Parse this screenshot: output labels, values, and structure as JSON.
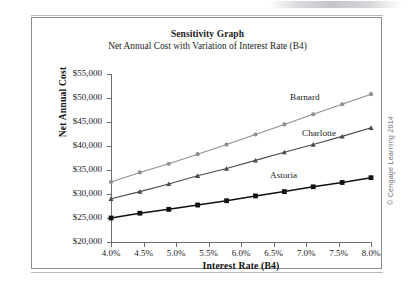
{
  "figure": {
    "credit": "© Cengage Learning 2014"
  },
  "chart_data": {
    "type": "line",
    "title": "Sensitivity Graph",
    "subtitle": "Net Annual Cost with Variation of Interest Rate (B4)",
    "xlabel": "Interest Rate (B4)",
    "ylabel": "Net Annual Cost",
    "xlim": [
      4.0,
      8.0
    ],
    "ylim": [
      20000,
      55000
    ],
    "grid": false,
    "legend_position": "inline-right-of-series",
    "x_tick_labels": [
      "4.0%",
      "4.5%",
      "5.0%",
      "5.5%",
      "6.0%",
      "6.5%",
      "7.0%",
      "7.5%",
      "8.0%"
    ],
    "x_tick_values": [
      4.0,
      4.5,
      5.0,
      5.5,
      6.0,
      6.5,
      7.0,
      7.5,
      8.0
    ],
    "y_tick_labels": [
      "$20,000",
      "$25,000",
      "$30,000",
      "$35,000",
      "$40,000",
      "$45,000",
      "$50,000",
      "$55,000"
    ],
    "y_tick_values": [
      20000,
      25000,
      30000,
      35000,
      40000,
      45000,
      50000,
      55000
    ],
    "x": [
      4.0,
      4.444,
      4.889,
      5.333,
      5.778,
      6.222,
      6.667,
      7.111,
      7.556,
      8.0
    ],
    "series": [
      {
        "name": "Barnard",
        "color": "#8e8e93",
        "marker": "circle",
        "values": [
          32500,
          34500,
          36300,
          38300,
          40300,
          42400,
          44500,
          46600,
          48700,
          50800
        ]
      },
      {
        "name": "Charlotte",
        "color": "#4a4a4e",
        "marker": "triangle",
        "values": [
          29000,
          30500,
          32100,
          33800,
          35300,
          37000,
          38700,
          40300,
          42000,
          43800
        ]
      },
      {
        "name": "Astoria",
        "color": "#111111",
        "marker": "square",
        "values": [
          25000,
          26000,
          26800,
          27700,
          28600,
          29600,
          30500,
          31500,
          32400,
          33400
        ]
      }
    ]
  }
}
